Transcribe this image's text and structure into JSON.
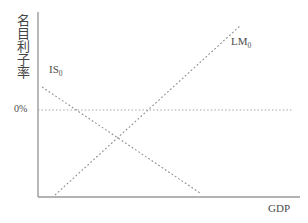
{
  "figure": {
    "background_color": "#ffffff",
    "axis_color": "#9a9a9a",
    "curve_color": "#8a8a8a",
    "text_color": "#4a4a4a"
  },
  "axes": {
    "y_title": "名目利子率",
    "x_title": "GDP",
    "zero_tick_label": "0%"
  },
  "labels": {
    "is_curve_name": "IS",
    "is_curve_subscript": "0",
    "lm_curve_name": "LM",
    "lm_curve_subscript": "0"
  },
  "chart_data": {
    "type": "line",
    "title": "",
    "xlabel": "GDP",
    "ylabel": "名目利子率",
    "grid": false,
    "legend": "inline-annotations",
    "annotations": [
      {
        "text": "IS0",
        "x": 49,
        "y": 64
      },
      {
        "text": "LM0",
        "x": 231,
        "y": 36
      },
      {
        "text": "0%",
        "x": 14,
        "y": 104
      }
    ],
    "reference_lines": [
      {
        "name": "zero-nominal-rate",
        "orientation": "horizontal",
        "value_label": "0%",
        "style": "dotted",
        "x_start": 38,
        "x_end": 292,
        "y": 110
      }
    ],
    "series": [
      {
        "name": "IS0",
        "style": "dotted",
        "slope": "negative",
        "points": [
          [
            42,
            87
          ],
          [
            200,
            193
          ]
        ]
      },
      {
        "name": "LM0",
        "style": "dotted",
        "slope": "positive",
        "points": [
          [
            55,
            195
          ],
          [
            241,
            25
          ]
        ]
      }
    ],
    "intersection": {
      "x": 120,
      "y": 140
    },
    "axis_lines": {
      "y_axis": {
        "x": 38,
        "y_top": 12,
        "y_bottom": 197
      },
      "x_axis": {
        "y": 197,
        "x_left": 38,
        "x_right": 300
      }
    }
  }
}
